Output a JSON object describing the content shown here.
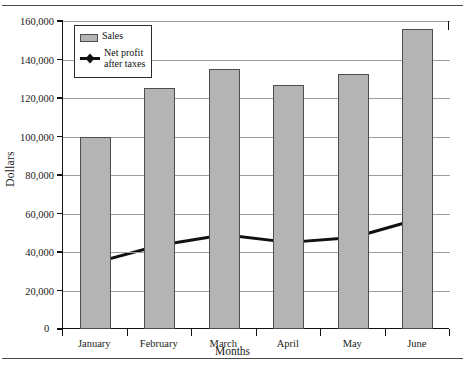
{
  "chart_data": {
    "type": "bar",
    "title": "",
    "xlabel": "Months",
    "ylabel": "Dollars",
    "categories": [
      "January",
      "February",
      "March",
      "April",
      "May",
      "June"
    ],
    "ylim": [
      0,
      160000
    ],
    "ytick_values": [
      0,
      20000,
      40000,
      60000,
      80000,
      100000,
      120000,
      140000,
      160000
    ],
    "ytick_labels": [
      "0",
      "20,000",
      "40,000",
      "60,000",
      "80,000",
      "100,000",
      "120,000",
      "140,000",
      "160,000"
    ],
    "grid": true,
    "legend_position": "top-left",
    "series": [
      {
        "name": "Sales",
        "type": "bar",
        "color": "#b4b4b4",
        "edge_color": "#4d4d4d",
        "values": [
          100000,
          125000,
          135000,
          127000,
          132500,
          156000
        ]
      },
      {
        "name": "Net profit after taxes",
        "type": "line",
        "color": "#111111",
        "marker": "diamond",
        "values": [
          34500,
          43500,
          49000,
          45000,
          47500,
          57000
        ]
      }
    ]
  },
  "legend": {
    "items": [
      {
        "label": "Sales",
        "swatch": "bar-swatch"
      },
      {
        "label_line1": "Net profit",
        "label_line2": "after taxes",
        "swatch": "line-marker-swatch"
      }
    ]
  },
  "axes": {
    "y_title": "Dollars",
    "x_title": "Months",
    "zero_label": "0"
  }
}
